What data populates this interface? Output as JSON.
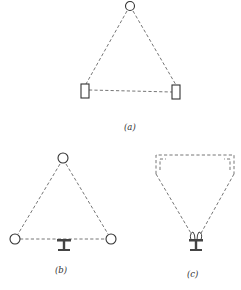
{
  "figure": {
    "panels": [
      {
        "id": "a",
        "label": "(a)",
        "description": "Triangle of dashed lines: circle at apex, two rectangles at base corners"
      },
      {
        "id": "b",
        "label": "(b)",
        "description": "Triangle of dashed lines: three circles at corners, I-beam below base center"
      },
      {
        "id": "c",
        "label": "(c)",
        "description": "Dashed trapezoid/funnel shape converging to I-beam with hooks"
      }
    ],
    "colors": {
      "line": "#666666",
      "outline": "#333333",
      "background": "#ffffff"
    }
  }
}
